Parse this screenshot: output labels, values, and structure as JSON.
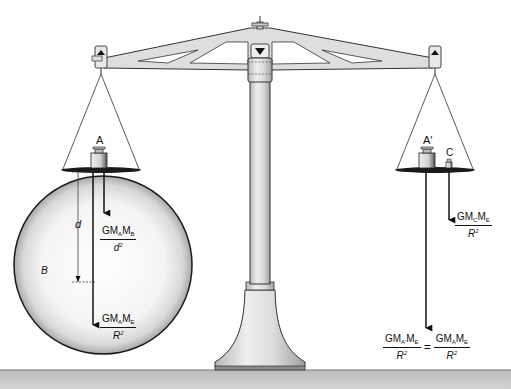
{
  "diagram": {
    "labels": {
      "mass_A": "A",
      "mass_A_prime": "A′",
      "mass_C": "C",
      "sphere_B": "B",
      "distance_d": "d"
    },
    "formulas": {
      "left_upper": {
        "num_G": "GM",
        "num_sub1": "A",
        "num_M": "M",
        "num_sub2": "B",
        "den": "d",
        "den_sup": "2"
      },
      "left_lower": {
        "num_G": "GM",
        "num_sub1": "A",
        "num_M": "M",
        "num_sub2": "E",
        "den": "R",
        "den_sup": "2"
      },
      "right_upper": {
        "num_G": "GM",
        "num_sub1": "C",
        "num_M": "M",
        "num_sub2": "E",
        "den": "R",
        "den_sup": "2"
      },
      "right_bottom_left": {
        "num_G": "GM",
        "num_sub1": "A'",
        "num_M": "M",
        "num_sub2": "E",
        "den": "R",
        "den_sup": "2"
      },
      "right_bottom_equals": "=",
      "right_bottom_right": {
        "num_G": "GM",
        "num_sub1": "A",
        "num_M": "M",
        "num_sub2": "E",
        "den": "R",
        "den_sup": "2"
      }
    },
    "colors": {
      "ink": "#111111",
      "metal": "#d9d9d9",
      "metal_dark": "#9a9a9a",
      "ground": "#c8c8c8",
      "sphere_edge": "#1a1a1a",
      "sphere_shade": "#bdbdbd"
    }
  }
}
